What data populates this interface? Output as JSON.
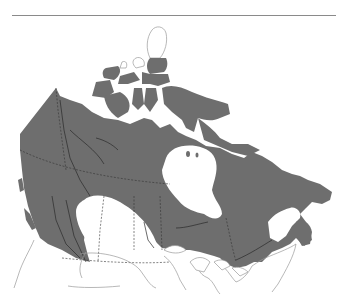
{
  "map": {
    "subject": "Canada range map",
    "region": "Canada and northern United States",
    "shaded_range_description": "Shaded distribution covering most of Canada except the southern prairies and the high Arctic islands",
    "legend": null,
    "labels": []
  },
  "colors": {
    "range_fill": "#6e6e6e",
    "outline_stroke": "#9a9a9a",
    "border_stroke": "#333333",
    "background": "#ffffff",
    "top_rule": "#8a8a8a"
  }
}
